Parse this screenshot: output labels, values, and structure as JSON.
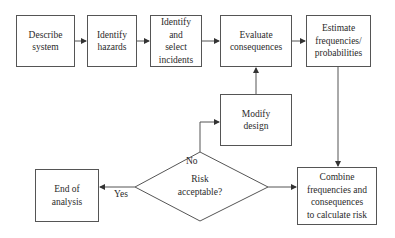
{
  "diagram": {
    "type": "flowchart",
    "nodes": {
      "describe_system": {
        "label": "Describe system",
        "lines": [
          "Describe",
          "system"
        ]
      },
      "identify_hazards": {
        "label": "Identify hazards",
        "lines": [
          "Identify",
          "hazards"
        ]
      },
      "identify_select_incidents": {
        "label": "Identify and select incidents",
        "lines": [
          "Identify and",
          "select",
          "incidents"
        ]
      },
      "evaluate_consequences": {
        "label": "Evaluate consequences",
        "lines": [
          "Evaluate",
          "consequences"
        ]
      },
      "estimate_frequencies": {
        "label": "Estimate frequencies/ probabilities",
        "lines": [
          "Estimate",
          "frequencies/",
          "probabilities"
        ]
      },
      "modify_design": {
        "label": "Modify design",
        "lines": [
          "Modify",
          "design"
        ]
      },
      "risk_acceptable": {
        "label": "Risk acceptable?",
        "lines": [
          "Risk",
          "acceptable?"
        ],
        "shape": "diamond"
      },
      "end_of_analysis": {
        "label": "End of analysis",
        "lines": [
          "End of",
          "analysis"
        ]
      },
      "combine": {
        "label": "Combine frequencies and consequences to calculate risk",
        "lines": [
          "Combine",
          "frequencies and",
          "consequences",
          "to calculate risk"
        ]
      }
    },
    "edge_labels": {
      "no": "No",
      "yes": "Yes"
    },
    "edges": [
      {
        "from": "Describe system",
        "to": "Identify hazards"
      },
      {
        "from": "Identify hazards",
        "to": "Identify and select incidents"
      },
      {
        "from": "Identify and select incidents",
        "to": "Evaluate consequences"
      },
      {
        "from": "Evaluate consequences",
        "to": "Estimate frequencies/ probabilities"
      },
      {
        "from": "Estimate frequencies/ probabilities",
        "to": "Combine frequencies and consequences to calculate risk"
      },
      {
        "from": "Combine frequencies and consequences to calculate risk",
        "to": "Risk acceptable?"
      },
      {
        "from": "Risk acceptable?",
        "to": "End of analysis",
        "label": "Yes"
      },
      {
        "from": "Risk acceptable?",
        "to": "Modify design",
        "label": "No"
      },
      {
        "from": "Modify design",
        "to": "Evaluate consequences"
      }
    ],
    "colors": {
      "stroke": "#555555",
      "text": "#2a2a2a",
      "background": "#ffffff"
    }
  }
}
